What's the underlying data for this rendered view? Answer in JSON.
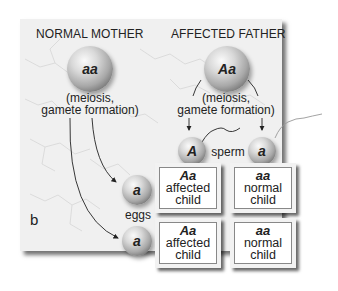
{
  "panel_label": "b",
  "mother": {
    "header": "NORMAL MOTHER",
    "genotype": "aa",
    "process_line1": "(meiosis,",
    "process_line2": "gamete formation)"
  },
  "father": {
    "header": "AFFECTED FATHER",
    "genotype": "Aa",
    "process_line1": "(meiosis,",
    "process_line2": "gamete formation)"
  },
  "sperm": {
    "label": "sperm",
    "alleles": [
      "A",
      "a"
    ]
  },
  "eggs": {
    "label": "eggs",
    "alleles": [
      "a",
      "a"
    ]
  },
  "punnett": [
    {
      "genotype": "Aa",
      "line1": "affected",
      "line2": "child"
    },
    {
      "genotype": "aa",
      "line1": "normal",
      "line2": "child"
    },
    {
      "genotype": "Aa",
      "line1": "affected",
      "line2": "child"
    },
    {
      "genotype": "aa",
      "line1": "normal",
      "line2": "child"
    }
  ]
}
